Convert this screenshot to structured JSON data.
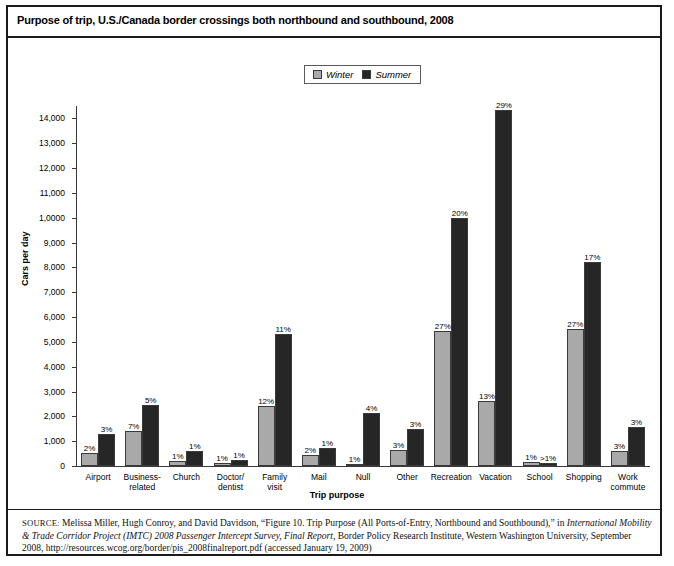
{
  "title": "Purpose of trip, U.S./Canada border crossings both northbound and southbound, 2008",
  "legend": {
    "winter_label": "Winter",
    "summer_label": "Summer"
  },
  "source": {
    "prefix": "SOURCE:",
    "part1": " Melissa Miller, Hugh Conroy, and David Davidson, “Figure 10. Trip Purpose (All Ports-of-Entry, Northbound and Southbound),” in ",
    "italic1": "International Mobility & Trade Corridor Project (IMTC) 2008 Passenger Intercept Survey, Final Report",
    "part2": ", Border Policy Research Institute, Western Washington University, September 2008, http://resources.wcog.org/border/pis_2008finalreport.pdf (accessed January 19, 2009)"
  },
  "chart_data": {
    "type": "bar",
    "title": "Purpose of trip, U.S./Canada border crossings both northbound and southbound, 2008",
    "xlabel": "Trip purpose",
    "ylabel": "Cars per day",
    "ylim": [
      0,
      14500
    ],
    "grid": false,
    "legend_position": "top-center",
    "ytick_labels": [
      "0",
      "1,000",
      "2,000",
      "3,000",
      "4,000",
      "5,000",
      "6,000",
      "7,000",
      "8,000",
      "9,000",
      "1,0000",
      "11,000",
      "12,000",
      "13,000",
      "14,000"
    ],
    "ytick_values": [
      0,
      1000,
      2000,
      3000,
      4000,
      5000,
      6000,
      7000,
      8000,
      9000,
      10000,
      11000,
      12000,
      13000,
      14000
    ],
    "categories": [
      "Airport",
      "Business-\nrelated",
      "Church",
      "Doctor/\ndentist",
      "Family\nvisit",
      "Mail",
      "Null",
      "Other",
      "Recreation",
      "Vacation",
      "School",
      "Shopping",
      "Work\ncommute"
    ],
    "series": [
      {
        "name": "Winter",
        "color": "#a9a9a9",
        "values": [
          530,
          1420,
          190,
          120,
          2430,
          430,
          100,
          640,
          5420,
          2620,
          170,
          5500,
          590
        ],
        "labels": [
          "2%",
          "7%",
          "1%",
          "1%",
          "12%",
          "2%",
          "1%",
          "3%",
          "27%",
          "13%",
          "1%",
          "27%",
          "3%"
        ]
      },
      {
        "name": "Summer",
        "color": "#262626",
        "values": [
          1280,
          2460,
          600,
          230,
          5300,
          720,
          2120,
          1490,
          9970,
          14330,
          110,
          8230,
          1560
        ],
        "labels": [
          "3%",
          "5%",
          "1%",
          "1%",
          "11%",
          "1%",
          "4%",
          "3%",
          "20%",
          "29%",
          ">1%",
          "17%",
          "3%"
        ]
      }
    ]
  }
}
